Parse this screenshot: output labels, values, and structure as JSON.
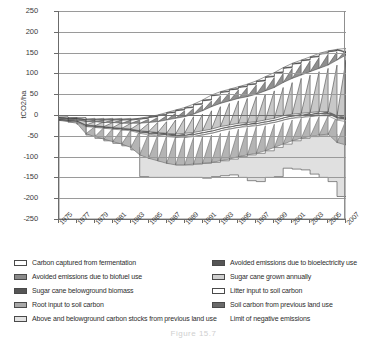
{
  "figure": {
    "caption": "Figure 15.7"
  },
  "axes": {
    "y_title": "tCO2/ha",
    "y_ticks": [
      "250",
      "200",
      "150",
      "100",
      "50",
      "0",
      "-50",
      "-100",
      "-150",
      "-200",
      "-250"
    ],
    "y_min": -250,
    "y_max": 250,
    "y_step": 50,
    "x_ticks": [
      "1975",
      "1977",
      "1979",
      "1981",
      "1983",
      "1985",
      "1987",
      "1989",
      "1991",
      "1993",
      "1995",
      "1997",
      "1999",
      "2001",
      "2003",
      "2005",
      "2007"
    ],
    "x_min": 1975,
    "x_max": 2007
  },
  "legend": {
    "left": [
      {
        "label": "Carbon captured from fermentation",
        "swatch": "s-white"
      },
      {
        "label": "Avoided emissions due to biofuel use",
        "swatch": "s-middark"
      },
      {
        "label": "Sugar cane  belowground biomass",
        "swatch": "s-darker"
      },
      {
        "label": "Root input to soil carbon",
        "swatch": "s-mid"
      },
      {
        "label": "Above and belowground carbon stocks from previous land use",
        "swatch": "s-light"
      }
    ],
    "right": [
      {
        "label": "Avoided emissions due to bioelectricity use",
        "swatch": "s-darker"
      },
      {
        "label": "Sugar cane  grown annually",
        "swatch": "s-midlight"
      },
      {
        "label": "Litter input to soil carbon",
        "swatch": "s-white"
      },
      {
        "label": "Soil carbon from previous land use",
        "swatch": "s-dark"
      },
      {
        "label": "Limit of negative emissions",
        "swatch": "s-none"
      }
    ]
  },
  "chart_data": {
    "type": "area",
    "title": "",
    "xlabel": "",
    "ylabel": "tCO2/ha",
    "ylim": [
      -250,
      250
    ],
    "grid": true,
    "legend_position": "below",
    "x": [
      1975,
      1976,
      1977,
      1978,
      1979,
      1980,
      1981,
      1982,
      1983,
      1984,
      1985,
      1986,
      1987,
      1988,
      1989,
      1990,
      1991,
      1992,
      1993,
      1994,
      1995,
      1996,
      1997,
      1998,
      1999,
      2000,
      2001,
      2002,
      2003,
      2004,
      2005,
      2006,
      2007
    ],
    "series": [
      {
        "name": "Above and belowground carbon stocks from previous land use",
        "note": "negative band, upper envelope (outer sawtooth lower bound)",
        "values": [
          -12,
          -14,
          -16,
          -30,
          -34,
          -38,
          -42,
          -46,
          -50,
          -55,
          -60,
          -64,
          -68,
          -72,
          -76,
          -80,
          -84,
          -88,
          -84,
          -80,
          -76,
          -70,
          -64,
          -58,
          -52,
          -46,
          -40,
          -36,
          -32,
          -28,
          -26,
          -34,
          -38
        ]
      },
      {
        "name": "Soil carbon from previous land use",
        "note": "lowest negative envelope (limit of negative emissions band bottom)",
        "values": [
          -13,
          -16,
          -20,
          -45,
          -52,
          -58,
          -64,
          -70,
          -78,
          -96,
          -104,
          -110,
          -116,
          -120,
          -120,
          -118,
          -116,
          -114,
          -110,
          -106,
          -100,
          -96,
          -92,
          -86,
          -78,
          -70,
          -62,
          -56,
          -52,
          -48,
          -46,
          -66,
          -72
        ]
      },
      {
        "name": "Limit of negative emissions",
        "note": "white step line inside the lower light band",
        "values": [
          -13,
          -17,
          -22,
          -48,
          -56,
          -62,
          -68,
          -74,
          -84,
          -148,
          -150,
          -150,
          -150,
          -150,
          -150,
          -150,
          -152,
          -148,
          -146,
          -144,
          -150,
          -158,
          -160,
          -150,
          -148,
          -128,
          -130,
          -132,
          -142,
          -150,
          -160,
          -196,
          -204
        ]
      },
      {
        "name": "Root input to soil carbon",
        "note": "mid-gray band just above the negative stock band, sawtooth",
        "values": [
          -12,
          -14,
          -16,
          -28,
          -30,
          -32,
          -34,
          -36,
          -38,
          -44,
          -48,
          -50,
          -52,
          -54,
          -54,
          -52,
          -48,
          -44,
          -38,
          -34,
          -30,
          -28,
          -26,
          -22,
          -18,
          -12,
          -8,
          -6,
          -4,
          -2,
          -2,
          -12,
          -16
        ]
      },
      {
        "name": "Sugar cane belowground biomass",
        "note": "dark narrow band, sawtooth peaks",
        "values": [
          -10,
          -12,
          -14,
          -24,
          -26,
          -28,
          -30,
          -32,
          -34,
          -38,
          -40,
          -42,
          -44,
          -46,
          -44,
          -42,
          -38,
          -34,
          -28,
          -24,
          -20,
          -18,
          -16,
          -12,
          -8,
          -2,
          2,
          4,
          6,
          8,
          8,
          -2,
          -6
        ]
      },
      {
        "name": "Sugar cane grown annually",
        "note": "light band producing the large sawtooth above zero",
        "values": [
          -8,
          -10,
          -10,
          -16,
          -16,
          -18,
          -18,
          -20,
          -20,
          -20,
          -18,
          -16,
          -12,
          -8,
          -4,
          2,
          10,
          20,
          28,
          34,
          40,
          44,
          50,
          58,
          66,
          78,
          88,
          96,
          104,
          112,
          120,
          132,
          144
        ]
      },
      {
        "name": "Avoided emissions due to biofuel use",
        "note": "upper sawtooth peak envelope",
        "values": [
          -6,
          -8,
          -8,
          -12,
          -12,
          -12,
          -12,
          -12,
          -12,
          -10,
          -6,
          -2,
          4,
          10,
          16,
          24,
          34,
          46,
          54,
          60,
          66,
          72,
          80,
          90,
          100,
          112,
          122,
          130,
          138,
          146,
          152,
          156,
          150
        ]
      },
      {
        "name": "Avoided emissions due to bioelectricity use",
        "note": "thin dark band at the sawtooth crest",
        "values": [
          -5,
          -7,
          -7,
          -10,
          -10,
          -10,
          -10,
          -10,
          -10,
          -8,
          -4,
          0,
          6,
          12,
          18,
          26,
          36,
          48,
          56,
          62,
          68,
          74,
          82,
          92,
          102,
          114,
          124,
          132,
          140,
          148,
          154,
          158,
          152
        ]
      },
      {
        "name": "Carbon captured from fermentation",
        "note": "white wedge between sawtooth teeth",
        "values": [
          -4,
          -6,
          -6,
          -8,
          -8,
          -8,
          -8,
          -8,
          -8,
          -6,
          -2,
          2,
          8,
          14,
          20,
          28,
          38,
          50,
          58,
          64,
          70,
          76,
          84,
          94,
          104,
          116,
          126,
          134,
          142,
          150,
          156,
          160,
          154
        ]
      },
      {
        "name": "Litter input to soil carbon",
        "note": "white sub-band inside the mid section",
        "values": [
          -11,
          -13,
          -15,
          -26,
          -28,
          -30,
          -32,
          -34,
          -36,
          -41,
          -44,
          -46,
          -48,
          -50,
          -49,
          -47,
          -43,
          -39,
          -33,
          -29,
          -25,
          -23,
          -21,
          -17,
          -13,
          -7,
          -3,
          -1,
          1,
          3,
          3,
          -7,
          -11
        ]
      }
    ]
  }
}
